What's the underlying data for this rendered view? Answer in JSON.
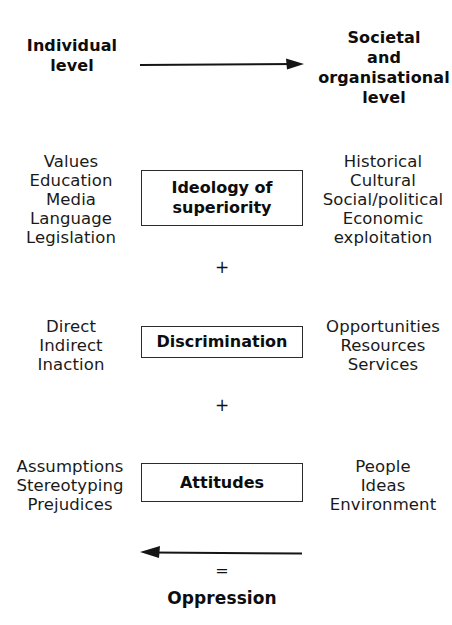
{
  "diagram": {
    "background_color": "#ffffff",
    "line_color": "#2b2b2b",
    "text_color": "#1a1a1a",
    "header": {
      "left": {
        "lines": [
          "Individual",
          "level"
        ]
      },
      "right": {
        "lines": [
          "Societal",
          "and",
          "organisational",
          "level"
        ]
      },
      "arrow": {
        "direction": "right",
        "label": ""
      }
    },
    "rows": [
      {
        "id": "ideology",
        "left": {
          "lines": [
            "Values",
            "Education",
            "Media",
            "Language",
            "Legislation"
          ]
        },
        "box": {
          "lines": [
            "Ideology of",
            "superiority"
          ]
        },
        "right": {
          "lines": [
            "Historical",
            "Cultural",
            "Social/political",
            "Economic",
            "exploitation"
          ]
        }
      },
      {
        "id": "discrimination",
        "left": {
          "lines": [
            "Direct",
            "Indirect",
            "Inaction"
          ]
        },
        "box": {
          "lines": [
            "Discrimination"
          ]
        },
        "right": {
          "lines": [
            "Opportunities",
            "Resources",
            "Services"
          ]
        }
      },
      {
        "id": "attitudes",
        "left": {
          "lines": [
            "Assumptions",
            "Stereotyping",
            "Prejudices"
          ]
        },
        "box": {
          "lines": [
            "Attitudes"
          ]
        },
        "right": {
          "lines": [
            "People",
            "Ideas",
            "Environment"
          ]
        }
      }
    ],
    "operators": {
      "plus_1": "+",
      "plus_2": "+",
      "equals": "="
    },
    "footer": {
      "arrow": {
        "direction": "left"
      },
      "label": "Oppression"
    }
  }
}
